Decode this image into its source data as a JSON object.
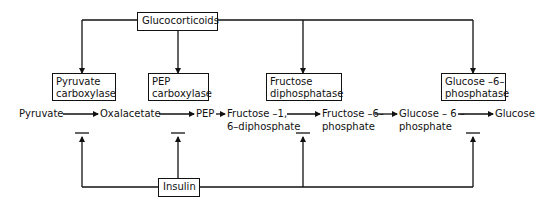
{
  "regulators": {
    "glucocorticoids": "Glucocorticoids",
    "insulin": "Insulin"
  },
  "enzymes": [
    {
      "line1": "Pyruvate",
      "line2": "carboxylase"
    },
    {
      "line1": "PEP",
      "line2": "carboxylase"
    },
    {
      "line1": "Fructose",
      "line2": "diphosphatase"
    },
    {
      "line1": "Glucose –6–",
      "line2": "phosphatase"
    }
  ],
  "pathway": [
    {
      "line1": "Pyruvate",
      "line2": ""
    },
    {
      "line1": "Oxalacetate",
      "line2": ""
    },
    {
      "line1": "PEP",
      "line2": ""
    },
    {
      "line1": "Fructose –1,",
      "line2": "6–diphosphate"
    },
    {
      "line1": "Fructose –6–",
      "line2": "phosphate"
    },
    {
      "line1": "Glucose – 6 –",
      "line2": "phosphate"
    },
    {
      "line1": "Glucose",
      "line2": ""
    }
  ],
  "relations": {
    "glucocorticoids_effect": "induces",
    "insulin_effect": "inhibits"
  }
}
